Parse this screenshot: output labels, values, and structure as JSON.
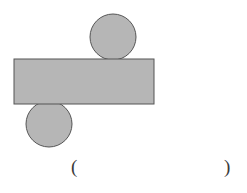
{
  "figure": {
    "background_color": "#ffffff",
    "shape_fill": "#b6b6b6",
    "shape_stroke": "#555555",
    "stroke_width": 1,
    "shapes": [
      {
        "name": "circle-top",
        "type": "circle",
        "cx": 113,
        "cy": 37,
        "r": 23,
        "fill": "#b6b6b6",
        "stroke": "#555555"
      },
      {
        "name": "circle-bottom",
        "type": "circle",
        "cx": 49,
        "cy": 124,
        "r": 23,
        "fill": "#b6b6b6",
        "stroke": "#555555"
      },
      {
        "name": "rectangle-bar",
        "type": "rect",
        "x": 14,
        "y": 59,
        "width": 140,
        "height": 45,
        "fill": "#b6b6b6",
        "stroke": "#555555"
      }
    ]
  },
  "caption": {
    "open_paren": "(",
    "close_paren": ")",
    "inner_text": "",
    "text_color": "#3a3a3a"
  }
}
